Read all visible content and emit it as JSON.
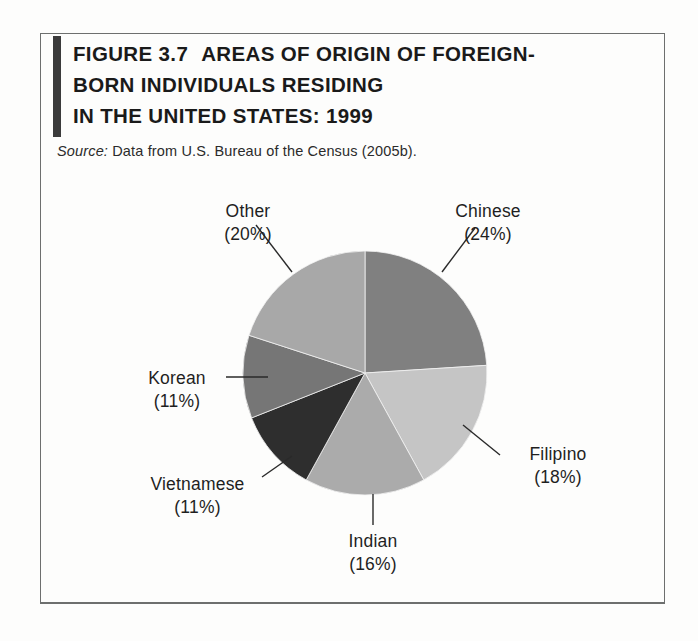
{
  "figure": {
    "label": "FIGURE 3.7",
    "title_line_1": "AREAS OF ORIGIN OF FOREIGN-",
    "title_line_2": "BORN INDIVIDUALS RESIDING",
    "title_line_3": "IN THE UNITED STATES: 1999",
    "source_keyword": "Source:",
    "source_text": "Data from U.S. Bureau of the Census (2005b)."
  },
  "chart_data": {
    "type": "pie",
    "subtitle": "Source: Data from U.S. Bureau of the Census (2005b).",
    "xlabel": "",
    "ylabel": "",
    "grid": false,
    "legend_position": "callout-labels",
    "start_angle_deg": 0,
    "direction": "clockwise",
    "labels": [
      "Chinese",
      "Filipino",
      "Indian",
      "Vietnamese",
      "Korean",
      "Other"
    ],
    "values": [
      24,
      18,
      16,
      11,
      11,
      20
    ],
    "value_unit": "%",
    "slices": [
      {
        "name": "Chinese",
        "value": 24,
        "label": "Chinese",
        "pct_label": "(24%)",
        "color": "#808080"
      },
      {
        "name": "Filipino",
        "value": 18,
        "label": "Filipino",
        "pct_label": "(18%)",
        "color": "#c5c5c5"
      },
      {
        "name": "Indian",
        "value": 16,
        "label": "Indian",
        "pct_label": "(16%)",
        "color": "#ababab"
      },
      {
        "name": "Vietnamese",
        "value": 11,
        "label": "Vietnamese",
        "pct_label": "(11%)",
        "color": "#2e2e2e"
      },
      {
        "name": "Korean",
        "value": 11,
        "label": "Korean",
        "pct_label": "(11%)",
        "color": "#767676"
      },
      {
        "name": "Other",
        "value": 20,
        "label": "Other",
        "pct_label": "(20%)",
        "color": "#a8a8a8"
      }
    ],
    "total": 100
  },
  "colors": {
    "accent_bar": "#3b3b3b",
    "frame": "#6d6f6e",
    "text": "#1a1a1a",
    "leader_line": "#2a2a2a"
  }
}
